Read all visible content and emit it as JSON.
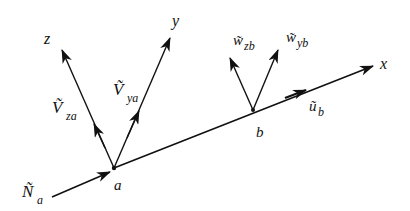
{
  "diagram": {
    "title": "",
    "axes": {
      "x": {
        "label": "x"
      },
      "y": {
        "label": "y"
      },
      "z": {
        "label": "z"
      }
    },
    "points": {
      "a": {
        "label": "a"
      },
      "b": {
        "label": "b"
      }
    },
    "vectors": {
      "N_a": {
        "symbol": "Ñ",
        "sub": "a"
      },
      "V_za": {
        "symbol": "Ṽ",
        "sub": "za"
      },
      "V_ya": {
        "symbol": "Ṽ",
        "sub": "ya"
      },
      "w_zb": {
        "symbol": "w̃",
        "sub": "zb"
      },
      "w_yb": {
        "symbol": "w̃",
        "sub": "yb"
      },
      "u_b": {
        "symbol": "ũ",
        "sub": "b"
      }
    },
    "colors": {
      "stroke": "#111111",
      "background": "#ffffff"
    }
  }
}
